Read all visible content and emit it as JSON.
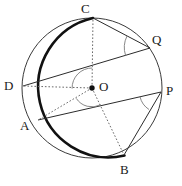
{
  "figure": {
    "background": "#ffffff",
    "stroke_color": "#2b2b2b",
    "thick_arc_color": "#111111",
    "dotted_color": "#555555",
    "arc_mark_color": "#6b6b6b",
    "circle": {
      "cx": 92,
      "cy": 88,
      "r": 70,
      "stroke_width": 1
    },
    "thick_arc": {
      "description": "bold arc from C counterclockwise through D and A to B",
      "from": "C",
      "to": "B",
      "stroke_width": 2.6
    },
    "points": [
      {
        "name": "C",
        "x": 93,
        "y": 18,
        "label": "C",
        "label_x": 81,
        "label_y": 2,
        "on_circle": true
      },
      {
        "name": "Q",
        "x": 150,
        "y": 48,
        "label": "Q",
        "label_x": 152,
        "label_y": 33,
        "on_circle": true
      },
      {
        "name": "P",
        "x": 161,
        "y": 92,
        "label": "P",
        "label_x": 165,
        "label_y": 84,
        "on_circle": true
      },
      {
        "name": "B",
        "x": 124,
        "y": 155,
        "label": "B",
        "label_x": 120,
        "label_y": 163,
        "on_circle": true
      },
      {
        "name": "A",
        "x": 38,
        "y": 120,
        "label": "A",
        "label_x": 20,
        "label_y": 119,
        "on_circle": true
      },
      {
        "name": "D",
        "x": 23,
        "y": 86,
        "label": "D",
        "label_x": 4,
        "label_y": 79,
        "on_circle": true
      },
      {
        "name": "O",
        "x": 92,
        "y": 88,
        "label": "O",
        "label_x": 99,
        "label_y": 80,
        "on_circle": false
      }
    ],
    "chords": [
      {
        "name": "chord-CQ",
        "from": "C",
        "to": "Q",
        "style": "solid"
      },
      {
        "name": "chord-DQ",
        "from": "D",
        "to": "Q",
        "style": "solid"
      },
      {
        "name": "chord-AP",
        "from": "A",
        "to": "P",
        "style": "solid"
      },
      {
        "name": "chord-BP",
        "from": "B",
        "to": "P",
        "style": "solid"
      }
    ],
    "radii": [
      {
        "name": "radius-OC",
        "from": "O",
        "to": "C",
        "style": "dotted"
      },
      {
        "name": "radius-OD",
        "from": "O",
        "to": "D",
        "style": "dotted"
      },
      {
        "name": "radius-OA",
        "from": "O",
        "to": "A",
        "style": "dotted"
      },
      {
        "name": "radius-OB",
        "from": "O",
        "to": "B",
        "style": "dotted"
      }
    ],
    "angle_marks": [
      {
        "name": "angle-at-Q",
        "vertex": "Q",
        "rays": [
          "C",
          "D"
        ]
      },
      {
        "name": "angle-at-P",
        "vertex": "P",
        "rays": [
          "A",
          "B"
        ]
      },
      {
        "name": "angle-COD-at-O",
        "vertex": "O",
        "rays": [
          "C",
          "D"
        ]
      },
      {
        "name": "angle-AOB-at-O",
        "vertex": "O",
        "rays": [
          "A",
          "B"
        ]
      }
    ]
  },
  "labels": {
    "C": "C",
    "Q": "Q",
    "P": "P",
    "B": "B",
    "A": "A",
    "D": "D",
    "O": "O"
  }
}
